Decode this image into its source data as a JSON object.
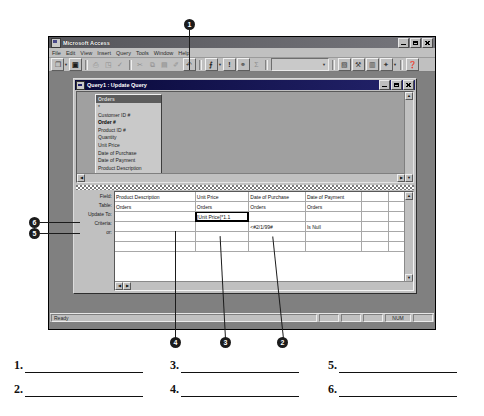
{
  "app": {
    "title": "Microsoft Access",
    "icon": "access-icon",
    "window_buttons": [
      "minimize",
      "restore",
      "close"
    ],
    "menus": [
      "File",
      "Edit",
      "View",
      "Insert",
      "Query",
      "Tools",
      "Window",
      "Help"
    ],
    "toolbar": [
      {
        "name": "view-button",
        "glyph": "❐",
        "state": "enabled",
        "has_arrow": true
      },
      {
        "name": "save-button",
        "glyph": "▣",
        "state": "enabled"
      },
      {
        "name": "print-button",
        "glyph": "⎙",
        "state": "disabled"
      },
      {
        "name": "print-preview-button",
        "glyph": "◳",
        "state": "disabled"
      },
      {
        "name": "spelling-button",
        "glyph": "✓",
        "state": "disabled"
      },
      {
        "name": "cut-button",
        "glyph": "✂",
        "state": "disabled"
      },
      {
        "name": "copy-button",
        "glyph": "⧉",
        "state": "disabled"
      },
      {
        "name": "paste-button",
        "glyph": "▤",
        "state": "disabled"
      },
      {
        "name": "format-painter-button",
        "glyph": "✐",
        "state": "disabled"
      },
      {
        "name": "undo-button",
        "glyph": "↶",
        "state": "enabled"
      },
      {
        "name": "query-type-button",
        "glyph": "⨍",
        "state": "enabled",
        "has_arrow": true
      },
      {
        "name": "run-button",
        "glyph": "!",
        "state": "enabled"
      },
      {
        "name": "show-table-button",
        "glyph": "⚭",
        "state": "enabled"
      },
      {
        "name": "totals-button",
        "glyph": "Σ",
        "state": "disabled"
      }
    ],
    "toolbar_right": [
      {
        "name": "top-values-combo",
        "value": "",
        "arrow": "▼"
      },
      {
        "name": "properties-button",
        "glyph": "▧",
        "state": "enabled"
      },
      {
        "name": "build-button",
        "glyph": "⚒",
        "state": "enabled"
      },
      {
        "name": "database-window-button",
        "glyph": "▥",
        "state": "enabled"
      },
      {
        "name": "new-object-button",
        "glyph": "✦",
        "state": "enabled",
        "has_arrow": true
      },
      {
        "name": "office-assistant-button",
        "glyph": "❓",
        "state": "enabled"
      }
    ],
    "statusbar": {
      "message": "Ready",
      "indicators": [
        "",
        "",
        "",
        "NUM",
        ""
      ]
    }
  },
  "query_window": {
    "title": "Query1 : Update Query",
    "icon": "query-icon",
    "window_buttons": [
      "minimize",
      "restore",
      "close"
    ],
    "field_list": {
      "table_name": "Orders",
      "fields": [
        {
          "label": "*",
          "bold": false
        },
        {
          "label": "Customer ID #",
          "bold": false
        },
        {
          "label": "Order #",
          "bold": true
        },
        {
          "label": "Product ID #",
          "bold": false
        },
        {
          "label": "Quantity",
          "bold": false
        },
        {
          "label": "Unit Price",
          "bold": false
        },
        {
          "label": "Date of Purchase",
          "bold": false
        },
        {
          "label": "Date of Payment",
          "bold": false
        },
        {
          "label": "Product Description",
          "bold": false
        }
      ]
    },
    "grid": {
      "row_labels": [
        "Field:",
        "Table:",
        "Update To:",
        "Criteria:",
        "or:"
      ],
      "columns": [
        {
          "field": "Product Description",
          "table": "Orders",
          "update_to": "",
          "criteria": "",
          "or": ""
        },
        {
          "field": "Unit Price",
          "table": "Orders",
          "update_to": "[Unit Price]*1.1",
          "criteria": "",
          "or": "",
          "selected_cell": "update_to"
        },
        {
          "field": "Date of Purchase",
          "table": "Orders",
          "update_to": "",
          "criteria": "<#2/1/99#",
          "or": ""
        },
        {
          "field": "Date of Payment",
          "table": "Orders",
          "update_to": "",
          "criteria": "Is Null",
          "or": ""
        },
        {
          "field": "",
          "table": "",
          "update_to": "",
          "criteria": "",
          "or": ""
        },
        {
          "field": "",
          "table": "",
          "update_to": "",
          "criteria": "",
          "or": ""
        }
      ]
    }
  },
  "callouts": [
    {
      "number": "1",
      "target": "query-type-toolbar-button"
    },
    {
      "number": "2",
      "target": "date-of-payment-criteria-cell"
    },
    {
      "number": "3",
      "target": "date-of-purchase-criteria-cell"
    },
    {
      "number": "4",
      "target": "unit-price-update-to-cell"
    },
    {
      "number": "5",
      "target": "criteria-row-label"
    },
    {
      "number": "6",
      "target": "update-to-row-label"
    }
  ],
  "answers": [
    {
      "number": "1."
    },
    {
      "number": "2."
    },
    {
      "number": "3."
    },
    {
      "number": "4."
    },
    {
      "number": "5."
    },
    {
      "number": "6."
    }
  ],
  "colors": {
    "desktop": "#808080",
    "window_face": "#c0c0c0",
    "title_active": "#1f1f6b",
    "grid_background": "#ffffff",
    "callout_fill": "#1b1b1b"
  }
}
